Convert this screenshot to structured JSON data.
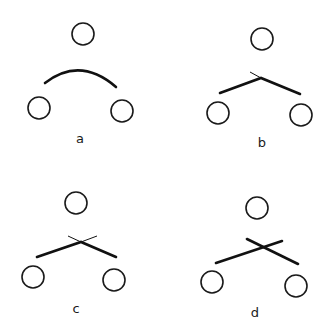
{
  "figure": {
    "panels": [
      {
        "label": "a",
        "description": "smooth arc between two lower nodes",
        "top_node": {
          "cx": 83,
          "cy": 34,
          "r": 11
        },
        "left_node": {
          "cx": 39,
          "cy": 108,
          "r": 11
        },
        "right_node": {
          "cx": 122,
          "cy": 111,
          "r": 11
        },
        "arc": {
          "from": [
            45,
            83
          ],
          "ctrl": [
            80,
            56
          ],
          "to": [
            116,
            87
          ]
        },
        "label_pos": [
          80,
          143
        ]
      },
      {
        "label": "b",
        "description": "kinked bond with small thin tick at apex",
        "top_node": {
          "cx": 262,
          "cy": 39,
          "r": 11
        },
        "left_node": {
          "cx": 218,
          "cy": 113,
          "r": 11
        },
        "right_node": {
          "cx": 301,
          "cy": 115,
          "r": 11
        },
        "thick_path": [
          [
            220,
            93
          ],
          [
            261,
            78
          ],
          [
            300,
            94
          ]
        ],
        "thin_path": [
          [
            250,
            72
          ],
          [
            261,
            78
          ]
        ],
        "label_pos": [
          262,
          147
        ]
      },
      {
        "label": "c",
        "description": "thick bonds meeting at crossing with thin extensions",
        "top_node": {
          "cx": 76,
          "cy": 203,
          "r": 11
        },
        "left_node": {
          "cx": 33,
          "cy": 277,
          "r": 11
        },
        "right_node": {
          "cx": 114,
          "cy": 280,
          "r": 11
        },
        "thick_path": [
          [
            37,
            257
          ],
          [
            81,
            242
          ],
          [
            116,
            257
          ]
        ],
        "thin_lines": [
          [
            [
              68,
              236
            ],
            [
              81,
              242
            ]
          ],
          [
            [
              81,
              242
            ],
            [
              97,
              236
            ]
          ]
        ],
        "label_pos": [
          76,
          313
        ]
      },
      {
        "label": "d",
        "description": "two crossing thick lines",
        "top_node": {
          "cx": 257,
          "cy": 208,
          "r": 11
        },
        "left_node": {
          "cx": 212,
          "cy": 282,
          "r": 11
        },
        "right_node": {
          "cx": 296,
          "cy": 286,
          "r": 11
        },
        "thick_lines": [
          [
            [
              216,
              263
            ],
            [
              282,
              241
            ]
          ],
          [
            [
              247,
              239
            ],
            [
              298,
              264
            ]
          ]
        ],
        "label_pos": [
          255,
          317
        ]
      }
    ]
  },
  "labels": {
    "a": "a",
    "b": "b",
    "c": "c",
    "d": "d"
  }
}
